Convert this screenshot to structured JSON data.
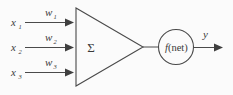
{
  "figure": {
    "background_color": "#fbfbfb",
    "stroke_color": "#4a4a4a",
    "text_color": "#3a3a3a"
  },
  "inputs": [
    {
      "symbol": "x",
      "subscript": "1",
      "weight_symbol": "w",
      "weight_subscript": "1"
    },
    {
      "symbol": "x",
      "subscript": "2",
      "weight_symbol": "w",
      "weight_subscript": "2"
    },
    {
      "symbol": "x",
      "subscript": "3",
      "weight_symbol": "w",
      "weight_subscript": "3"
    }
  ],
  "summation": {
    "symbol": "Σ",
    "shape": "triangle"
  },
  "activation": {
    "f_label": "f",
    "arg_label": "(net)",
    "shape": "circle"
  },
  "output": {
    "symbol": "y"
  },
  "icons": {
    "arrow": "arrow-right-icon"
  }
}
